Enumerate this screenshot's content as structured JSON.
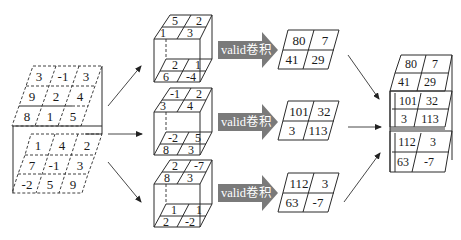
{
  "diagram": {
    "title": "",
    "input": {
      "description": "3x3x3 input tensor split into slices",
      "slices": [
        [
          [
            3,
            -1,
            3
          ],
          [
            9,
            2,
            4
          ],
          [
            8,
            1,
            5
          ]
        ],
        [
          [
            1,
            4,
            2
          ],
          [
            7,
            -1,
            3
          ],
          [
            -2,
            5,
            9
          ]
        ]
      ],
      "top_rows": [
        "3",
        "-1",
        "3",
        "9",
        "2",
        "4",
        "8",
        "1",
        "5"
      ],
      "front_rows": [
        "1",
        "4",
        "2",
        "7",
        "-1",
        "3",
        "-2",
        "5",
        "9"
      ]
    },
    "kernels": [
      {
        "top": [
          "5",
          "2",
          "1",
          "3"
        ],
        "bottom": [
          "2",
          "1",
          "6",
          "-4"
        ]
      },
      {
        "top": [
          "-1",
          "2",
          "3",
          "4"
        ],
        "bottom": [
          "-2",
          "5",
          "8",
          "3"
        ]
      },
      {
        "top": [
          "2",
          "-7",
          "8",
          "3"
        ],
        "bottom": [
          "1",
          "1",
          "2",
          "-2"
        ]
      }
    ],
    "operation_label": "valid卷积",
    "operations": [
      {
        "label": "valid卷积"
      },
      {
        "label": "valid卷积"
      },
      {
        "label": "valid卷积"
      }
    ],
    "outputs": [
      {
        "cells": [
          "80",
          "7",
          "41",
          "29"
        ]
      },
      {
        "cells": [
          "101",
          "32",
          "3",
          "113"
        ]
      },
      {
        "cells": [
          "112",
          "3",
          "63",
          "-7"
        ]
      }
    ],
    "stacked_output": {
      "cells": [
        "80",
        "7",
        "41",
        "29",
        "101",
        "32",
        "3",
        "113",
        "112",
        "3",
        "63",
        "-7"
      ]
    },
    "colors": {
      "arrow_fill": "#7a7a7a",
      "line": "#2a2a2a",
      "background": "#ffffff"
    }
  }
}
